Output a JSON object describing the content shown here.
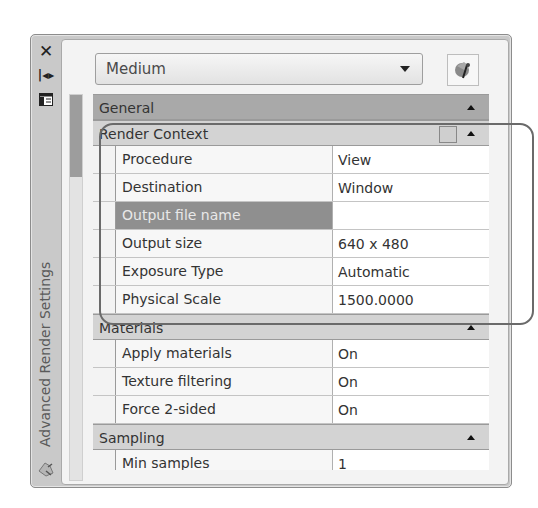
{
  "palette": {
    "title": "Advanced Render Settings",
    "titlebar_icons": [
      "close-icon",
      "auto-hide-icon",
      "properties-icon"
    ],
    "preset": {
      "selected": "Medium"
    },
    "manage_button": {
      "icon": "render-presets-icon"
    }
  },
  "sections": {
    "general": {
      "label": "General"
    },
    "render_context": {
      "label": "Render Context",
      "rows": [
        {
          "label": "Procedure",
          "value": "View"
        },
        {
          "label": "Destination",
          "value": "Window"
        },
        {
          "label": "Output file name",
          "value": ""
        },
        {
          "label": "Output size",
          "value": "640 x 480"
        },
        {
          "label": "Exposure Type",
          "value": "Automatic"
        },
        {
          "label": "Physical Scale",
          "value": "1500.0000"
        }
      ]
    },
    "materials": {
      "label": "Materials",
      "rows": [
        {
          "label": "Apply materials",
          "value": "On"
        },
        {
          "label": "Texture filtering",
          "value": "On"
        },
        {
          "label": "Force 2-sided",
          "value": "On"
        }
      ]
    },
    "sampling": {
      "label": "Sampling",
      "rows": [
        {
          "label": "Min samples",
          "value": "1"
        }
      ]
    }
  }
}
